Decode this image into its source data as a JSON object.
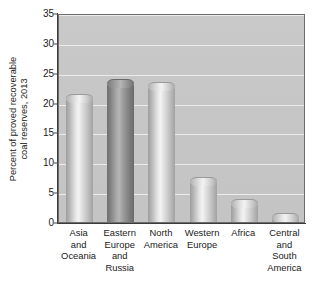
{
  "chart_data": {
    "type": "bar",
    "title": "",
    "subtitle": "",
    "xlabel": "",
    "ylabel": "Percent of proved recoverable coal reserves, 2013",
    "ylabel_lines": [
      "Percent of proved recoverable",
      "coal reserves, 2013"
    ],
    "categories": [
      "Asia and Oceania",
      "Eastern Europe and Russia",
      "North America",
      "Western Europe",
      "Africa",
      "Central and South America"
    ],
    "category_lines": [
      [
        "Asia",
        "and",
        "Oceania"
      ],
      [
        "Eastern",
        "Europe",
        "and",
        "Russia"
      ],
      [
        "North",
        "America"
      ],
      [
        "Western",
        "Europe"
      ],
      [
        "Africa"
      ],
      [
        "Central",
        "and",
        "South",
        "America"
      ]
    ],
    "values": [
      21.4,
      24.0,
      23.5,
      7.5,
      3.8,
      1.5
    ],
    "ylim": [
      0,
      35
    ],
    "ytick_values": [
      0,
      5,
      10,
      15,
      20,
      25,
      30,
      35
    ],
    "ytick_labels": [
      "0",
      "5",
      "10",
      "15",
      "20",
      "25",
      "30",
      "35"
    ],
    "grid": true,
    "grid_axis": "y",
    "legend": false,
    "legend_position": "none",
    "bar_styles": [
      "light",
      "dark",
      "light",
      "light",
      "light",
      "light"
    ],
    "colors": {
      "plot_background": "#c6c6c6",
      "gridline": "#ececed",
      "axis": "#3a3a3a",
      "bar_light": "#d8d8d8",
      "bar_dark": "#8f8f8f",
      "text": "#1a1a1a",
      "page_background": "#ffffff"
    }
  },
  "caption": {
    "clipped_text": ""
  }
}
